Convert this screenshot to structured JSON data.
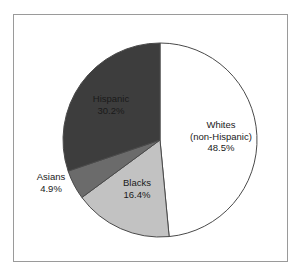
{
  "figure": {
    "background_color": "#ffffff",
    "frame_color": "#9a9a9a",
    "label_text_color": "#1a1a1a"
  },
  "chart_data": {
    "type": "pie",
    "title": "",
    "subtitle": "",
    "xlabel": "",
    "ylabel": "",
    "legend": "none",
    "grid": false,
    "start_angle_deg": 0,
    "direction": "clockwise",
    "units": "percent",
    "categories": [
      "Whites (non-Hispanic)",
      "Blacks",
      "Asians",
      "Hispanic"
    ],
    "values": [
      48.5,
      16.4,
      4.9,
      30.2
    ],
    "slices": [
      {
        "name": "Whites",
        "name_line2": "(non-Hispanic)",
        "label": "Whites (non-Hispanic)",
        "value": 48.5,
        "value_label": "48.5%",
        "color": "#ffffff",
        "stroke": "#4a4a4a",
        "label_position": "inside"
      },
      {
        "name": "Blacks",
        "name_line2": "",
        "label": "Blacks",
        "value": 16.4,
        "value_label": "16.4%",
        "color": "#c2c2c2",
        "stroke": "#4a4a4a",
        "label_position": "inside"
      },
      {
        "name": "Asians",
        "name_line2": "",
        "label": "Asians",
        "value": 4.9,
        "value_label": "4.9%",
        "color": "#6b6b6b",
        "stroke": "#4a4a4a",
        "label_position": "outside-left"
      },
      {
        "name": "Hispanic",
        "name_line2": "",
        "label": "Hispanic",
        "value": 30.2,
        "value_label": "30.2%",
        "color": "#3d3d3d",
        "stroke": "#4a4a4a",
        "label_position": "inside"
      }
    ]
  },
  "geometry": {
    "center_x": 160,
    "center_y": 140,
    "radius": 97
  }
}
